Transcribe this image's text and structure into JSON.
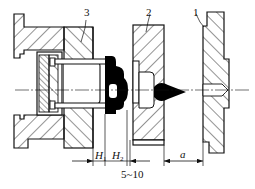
{
  "diagram": {
    "type": "mechanical cross-section",
    "part_labels": [
      {
        "id": "1",
        "text": "1"
      },
      {
        "id": "2",
        "text": "2"
      },
      {
        "id": "3",
        "text": "3"
      }
    ],
    "dimensions": {
      "h1": {
        "main": "H",
        "sub": "1"
      },
      "h2": {
        "main": "H",
        "sub": "2"
      },
      "gap": "5~10",
      "a": "a"
    },
    "colors": {
      "line": "#111111",
      "part_fill": "#000000",
      "background": "#ffffff"
    }
  }
}
